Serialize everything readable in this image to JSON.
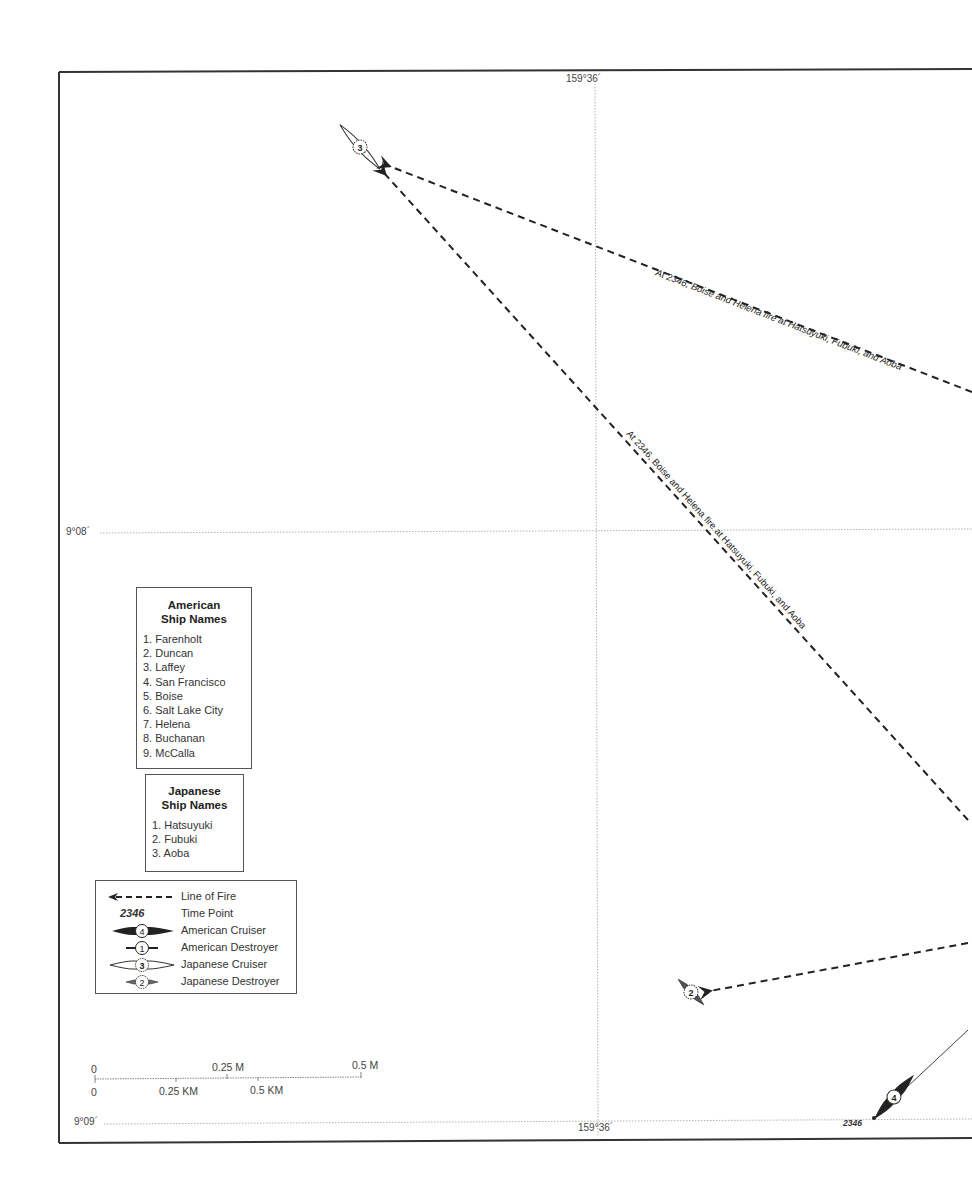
{
  "map": {
    "grid_labels": {
      "top_longitude": "159°36´",
      "bottom_longitude": "159°36´",
      "latitude_mid": "9°08´",
      "latitude_bottom": "9°09´"
    },
    "annotations": {
      "fire_line_upper": "At 2346, Boise and Helena fire at Hatsuyuki, Fubuki, and Aoba",
      "fire_line_diagonal": "At 2346, Boise and Helena fire at Hatsuyuki, Fubuki, and Aoba",
      "time_point": "2346"
    },
    "ships": [
      {
        "id": "japanese-cruiser-3",
        "type": "Japanese Cruiser",
        "number": "3"
      },
      {
        "id": "japanese-destroyer-2",
        "type": "Japanese Destroyer",
        "number": "2"
      },
      {
        "id": "american-cruiser-4",
        "type": "American Cruiser",
        "number": "4"
      }
    ],
    "colors": {
      "ink": "#222222",
      "grid": "#9a9a9a",
      "frame": "#333333",
      "background": "#ffffff"
    }
  },
  "legend": {
    "american": {
      "title_line1": "American",
      "title_line2": "Ship Names",
      "items": [
        "1. Farenholt",
        "2. Duncan",
        "3. Laffey",
        "4. San Francisco",
        "5. Boise",
        "6. Salt Lake City",
        "7. Helena",
        "8. Buchanan",
        "9. McCalla"
      ]
    },
    "japanese": {
      "title_line1": "Japanese",
      "title_line2": "Ship Names",
      "items": [
        "1. Hatsuyuki",
        "2. Fubuki",
        "3. Aoba"
      ]
    },
    "key": [
      {
        "symbol": "line-of-fire",
        "label": "Line of Fire"
      },
      {
        "symbol": "time-point",
        "symbol_text": "2346",
        "label": "Time Point"
      },
      {
        "symbol": "american-cruiser",
        "symbol_text": "4",
        "label": "American Cruiser"
      },
      {
        "symbol": "american-destroyer",
        "symbol_text": "1",
        "label": "American Destroyer"
      },
      {
        "symbol": "japanese-cruiser",
        "symbol_text": "3",
        "label": "Japanese Cruiser"
      },
      {
        "symbol": "japanese-destroyer",
        "symbol_text": "2",
        "label": "Japanese Destroyer"
      }
    ]
  },
  "scale_bar": {
    "miles": {
      "start": "0",
      "mid": "0.25 M",
      "end": "0.5 M"
    },
    "kilometers": {
      "start": "0",
      "mid": "0.25 KM",
      "end": "0.5 KM"
    }
  }
}
